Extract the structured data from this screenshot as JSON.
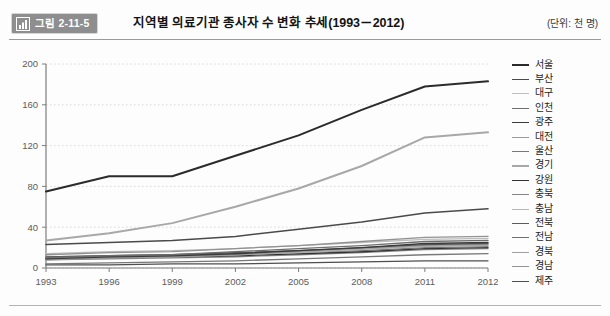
{
  "figure": {
    "badge_label": "그림 2-11-5",
    "badge_icon": "bar-chart-icon",
    "title": "지역별 의료기관 종사자 수 변화 추세(1993－2012)",
    "unit_note": "(단위: 천 명)"
  },
  "chart_data": {
    "type": "line",
    "title": "지역별 의료기관 종사자 수 변화 추세(1993－2012)",
    "xlabel": "",
    "ylabel": "",
    "unit": "천 명",
    "grid": true,
    "legend_position": "right",
    "xlim": [
      1993,
      2012
    ],
    "ylim": [
      0,
      200
    ],
    "yticks": [
      0,
      40,
      80,
      120,
      160,
      200
    ],
    "categories": [
      "1993",
      "1996",
      "1999",
      "2002",
      "2005",
      "2008",
      "2011",
      "2012"
    ],
    "x": [
      1993,
      1996,
      1999,
      2002,
      2005,
      2008,
      2011,
      2012
    ],
    "series": [
      {
        "name": "서울",
        "color": "#2b2b2b",
        "width": 2.0,
        "values": [
          75,
          90,
          90,
          110,
          130,
          155,
          178,
          183
        ]
      },
      {
        "name": "부산",
        "color": "#4a4a4a",
        "width": 1.5,
        "values": [
          23,
          25,
          27,
          31,
          38,
          45,
          54,
          58
        ]
      },
      {
        "name": "대구",
        "color": "#bdbdbd",
        "width": 1.3,
        "values": [
          14,
          16,
          17,
          19,
          22,
          25,
          28,
          29
        ]
      },
      {
        "name": "인천",
        "color": "#6e6e6e",
        "width": 1.3,
        "values": [
          10,
          12,
          13,
          16,
          19,
          22,
          26,
          27
        ]
      },
      {
        "name": "광주",
        "color": "#3a3a3a",
        "width": 1.4,
        "values": [
          9,
          11,
          12,
          14,
          17,
          20,
          24,
          25
        ]
      },
      {
        "name": "대전",
        "color": "#9a9a9a",
        "width": 1.3,
        "values": [
          8,
          10,
          11,
          13,
          16,
          19,
          22,
          23
        ]
      },
      {
        "name": "울산",
        "color": "#787878",
        "width": 1.3,
        "values": [
          4,
          5,
          6,
          7,
          9,
          11,
          13,
          14
        ]
      },
      {
        "name": "경기",
        "color": "#a8a8a8",
        "width": 2.0,
        "values": [
          27,
          34,
          44,
          60,
          78,
          100,
          128,
          133
        ]
      },
      {
        "name": "강원",
        "color": "#333333",
        "width": 1.4,
        "values": [
          9,
          10,
          11,
          12,
          14,
          16,
          19,
          20
        ]
      },
      {
        "name": "충북",
        "color": "#868686",
        "width": 1.3,
        "values": [
          8,
          9,
          10,
          11,
          13,
          15,
          18,
          19
        ]
      },
      {
        "name": "충남",
        "color": "#b5b5b5",
        "width": 1.3,
        "values": [
          9,
          10,
          11,
          13,
          15,
          18,
          21,
          22
        ]
      },
      {
        "name": "전북",
        "color": "#5a5a5a",
        "width": 1.3,
        "values": [
          11,
          12,
          13,
          15,
          17,
          20,
          23,
          24
        ]
      },
      {
        "name": "전남",
        "color": "#707070",
        "width": 1.3,
        "values": [
          10,
          11,
          12,
          13,
          15,
          17,
          20,
          21
        ]
      },
      {
        "name": "경북",
        "color": "#a0a0a0",
        "width": 1.3,
        "values": [
          11,
          12,
          13,
          15,
          17,
          19,
          22,
          23
        ]
      },
      {
        "name": "경남",
        "color": "#929292",
        "width": 1.3,
        "values": [
          13,
          15,
          16,
          19,
          22,
          26,
          30,
          31
        ]
      },
      {
        "name": "제주",
        "color": "#4f4f4f",
        "width": 1.3,
        "values": [
          3,
          3,
          4,
          4,
          5,
          6,
          7,
          7
        ]
      }
    ]
  }
}
